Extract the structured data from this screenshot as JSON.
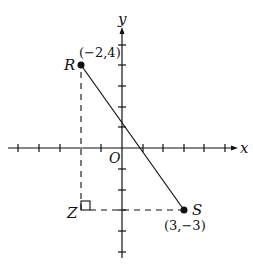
{
  "diagram": {
    "type": "coordinate-plane",
    "axes": {
      "x_label": "x",
      "y_label": "y",
      "origin_label": "O",
      "x_ticks": [
        -5,
        -4,
        -3,
        -2,
        -1,
        1,
        2,
        3,
        4,
        5
      ],
      "y_ticks": [
        -5,
        -4,
        -3,
        -2,
        -1,
        1,
        2,
        3,
        4
      ]
    },
    "points": [
      {
        "name": "R",
        "coords_label": "(−2,4)",
        "x": -2,
        "y": 4
      },
      {
        "name": "S",
        "coords_label": "(3,−3)",
        "x": 3,
        "y": -3
      },
      {
        "name": "Z",
        "x": -2,
        "y": -3
      }
    ],
    "segments": [
      {
        "from": "R",
        "to": "S",
        "style": "solid"
      },
      {
        "from": "R",
        "to": "Z",
        "style": "dashed"
      },
      {
        "from": "Z",
        "to": "S",
        "style": "dashed"
      }
    ],
    "right_angle_at": "Z",
    "colors": {
      "ink": "#111111",
      "background": "#ffffff"
    }
  }
}
